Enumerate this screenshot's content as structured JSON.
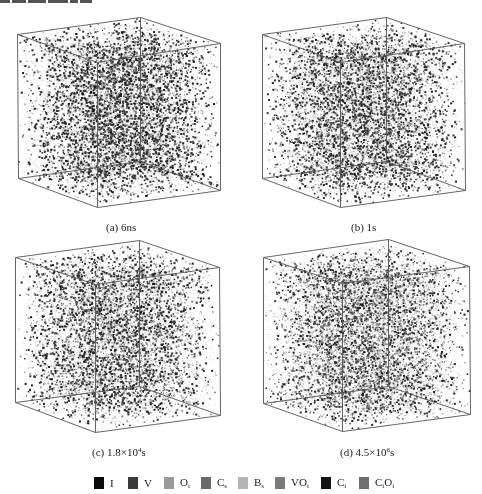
{
  "header_fragment": {
    "note": "cropped text line at top edge (illegible)"
  },
  "figure": {
    "panels": [
      {
        "id": "a",
        "caption_prefix": "(a) ",
        "caption_main": "6ns",
        "caption_exp": "",
        "caption_suffix": "",
        "caption_pos": [
          106,
          221
        ],
        "cube": {
          "top_left": [
            17,
            34
          ],
          "top_back": [
            140,
            17
          ],
          "top_right": [
            220,
            43
          ],
          "front_top": [
            97,
            62
          ],
          "bottom_left": [
            18,
            178
          ],
          "front_bottom": [
            97,
            207
          ],
          "bottom_right": [
            220,
            190
          ],
          "back_bottom": [
            140,
            161
          ]
        },
        "density": 5200,
        "dark_ratio": 0.42,
        "seed": 11
      },
      {
        "id": "b",
        "caption_prefix": "(b) ",
        "caption_main": "1s",
        "caption_exp": "",
        "caption_suffix": "",
        "caption_pos": [
          351,
          221
        ],
        "cube": {
          "top_left": [
            262,
            34
          ],
          "top_back": [
            386,
            17
          ],
          "top_right": [
            464,
            43
          ],
          "front_top": [
            340,
            62
          ],
          "bottom_left": [
            262,
            178
          ],
          "front_bottom": [
            340,
            207
          ],
          "bottom_right": [
            465,
            190
          ],
          "back_bottom": [
            386,
            161
          ]
        },
        "density": 4800,
        "dark_ratio": 0.36,
        "seed": 23
      },
      {
        "id": "c",
        "caption_prefix": "(c) ",
        "caption_main": "1.8×10",
        "caption_exp": "4",
        "caption_suffix": "s",
        "caption_pos": [
          92,
          446
        ],
        "cube": {
          "top_left": [
            15,
            257
          ],
          "top_back": [
            139,
            240
          ],
          "top_right": [
            219,
            267
          ],
          "front_top": [
            95,
            284
          ],
          "bottom_left": [
            15,
            402
          ],
          "front_bottom": [
            95,
            432
          ],
          "bottom_right": [
            220,
            415
          ],
          "back_bottom": [
            139,
            386
          ]
        },
        "density": 4600,
        "dark_ratio": 0.34,
        "seed": 37
      },
      {
        "id": "d",
        "caption_prefix": "(d) ",
        "caption_main": "4.5×10",
        "caption_exp": "6",
        "caption_suffix": "s",
        "caption_pos": [
          340,
          446
        ],
        "cube": {
          "top_left": [
            263,
            257
          ],
          "top_back": [
            388,
            239
          ],
          "top_right": [
            469,
            266
          ],
          "front_top": [
            342,
            283
          ],
          "bottom_left": [
            263,
            403
          ],
          "front_bottom": [
            342,
            431
          ],
          "bottom_right": [
            470,
            414
          ],
          "back_bottom": [
            388,
            386
          ]
        },
        "density": 5400,
        "dark_ratio": 0.22,
        "seed": 53
      }
    ]
  },
  "legend": {
    "items": [
      {
        "label": "I",
        "sub": "",
        "color": "#0a0a0a",
        "x": 94
      },
      {
        "label": "V",
        "sub": "",
        "color": "#3a3a3a",
        "x": 128
      },
      {
        "label": "O",
        "sub": "i",
        "color": "#9a9a9a",
        "x": 164
      },
      {
        "label": "C",
        "sub": "s",
        "color": "#6a6a6a",
        "x": 201
      },
      {
        "label": "B",
        "sub": "s",
        "color": "#b4b4b4",
        "x": 238
      },
      {
        "label": "VO",
        "sub": "i",
        "color": "#7c7c7c",
        "x": 275
      },
      {
        "label": "C",
        "sub": "i",
        "color": "#141414",
        "x": 321
      },
      {
        "label": "C",
        "sub": "i",
        "label2": "O",
        "sub2": "i",
        "color": "#6e6e6e",
        "x": 359
      }
    ]
  }
}
